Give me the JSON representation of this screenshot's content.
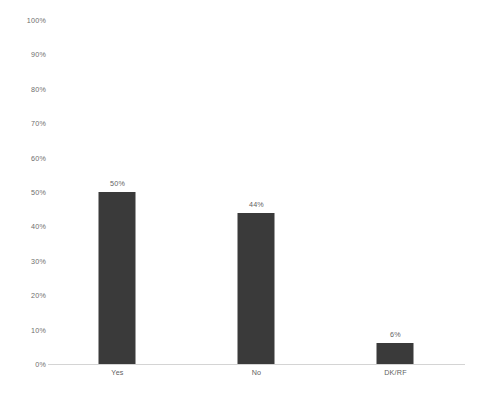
{
  "chart_data": {
    "type": "bar",
    "title": "",
    "subtitle": "",
    "xlabel": "",
    "ylabel": "",
    "categories": [
      "Yes",
      "No",
      "DK/RF"
    ],
    "values": [
      50,
      44,
      6
    ],
    "value_labels": [
      "50%",
      "44%",
      "6%"
    ],
    "ylim": [
      0,
      100
    ],
    "yticks": [
      0,
      10,
      20,
      30,
      40,
      50,
      60,
      70,
      80,
      90,
      100
    ],
    "ytick_labels": [
      "0%",
      "10%",
      "20%",
      "30%",
      "40%",
      "50%",
      "60%",
      "70%",
      "80%",
      "90%",
      "100%"
    ],
    "grid": false,
    "legend": null,
    "annotations": [],
    "colors": {
      "bar": "#3a3a3a",
      "background": "#ffffff",
      "axis_line": "#d4d4d4",
      "tick_text": "#6e6e6e",
      "value_text": "#5f5f5f"
    }
  }
}
